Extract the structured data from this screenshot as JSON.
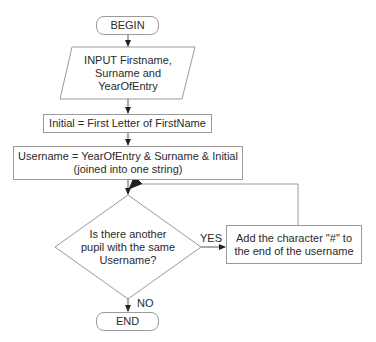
{
  "flowchart": {
    "begin": "BEGIN",
    "input": "INPUT Firstname, Surname and YearOfEntry",
    "initial": "Initial = First Letter of FirstName",
    "username_line1": "Username = YearOfEntry & Surname & Initial",
    "username_line2": "(joined into one string)",
    "decision": "Is there another pupil with the same Username?",
    "yes_label": "YES",
    "no_label": "NO",
    "add_char": "Add the character \"#\" to the end of the username",
    "end": "END"
  },
  "colors": {
    "stroke": "#9a9a9a",
    "arrow": "#222222",
    "text": "#2a2a2a"
  }
}
